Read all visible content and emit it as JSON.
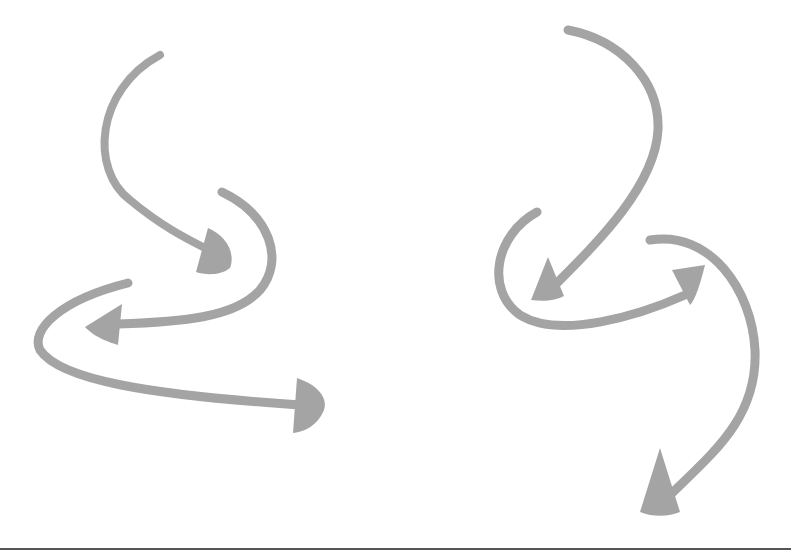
{
  "illustration": {
    "description": "Five gray hand-drawn curved arrows on a white background",
    "colors": {
      "arrow": "#a4a4a4",
      "background": "#ffffff",
      "rule": "#555555"
    },
    "arrows": [
      {
        "id": "left-top-down",
        "direction": "down-right"
      },
      {
        "id": "left-middle-left",
        "direction": "left"
      },
      {
        "id": "left-bottom-right",
        "direction": "right"
      },
      {
        "id": "right-top-down",
        "direction": "down-left"
      },
      {
        "id": "right-middle-up",
        "direction": "up-right"
      },
      {
        "id": "right-bottom-down",
        "direction": "down-left"
      }
    ]
  }
}
